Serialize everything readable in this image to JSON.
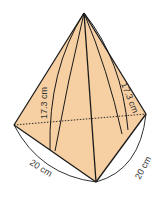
{
  "diagram": {
    "type": "pyramid-net-3d",
    "fill_color": "#f6cfa3",
    "stroke_color": "#1a1a1a",
    "labels": {
      "left_slant_height": "17.3 cm",
      "right_slant_height": "17.3 cm",
      "bottom_left_base": "20 cm",
      "bottom_right_base": "20 cm"
    }
  }
}
